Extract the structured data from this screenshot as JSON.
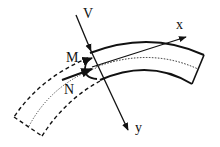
{
  "diagram": {
    "labels": {
      "shear": "V",
      "moment": "M",
      "normal": "N",
      "x_axis": "x",
      "y_axis": "y"
    },
    "colors": {
      "stroke": "#111111",
      "background": "#ffffff"
    }
  }
}
